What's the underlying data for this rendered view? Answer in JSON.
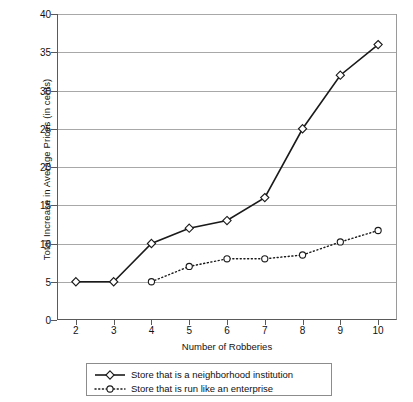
{
  "chart_data": {
    "type": "line",
    "title": "",
    "xlabel": "Number of Robberies",
    "ylabel": "Total Increase in Average Prices (in cents)",
    "x": [
      2,
      3,
      4,
      5,
      6,
      7,
      8,
      9,
      10
    ],
    "xlim": [
      1.5,
      10.5
    ],
    "ylim": [
      0,
      40
    ],
    "yticks": [
      0,
      5,
      10,
      15,
      20,
      25,
      30,
      35,
      40
    ],
    "xticks": [
      2,
      3,
      4,
      5,
      6,
      7,
      8,
      9,
      10
    ],
    "grid": "horizontal",
    "legend_position": "below",
    "series": [
      {
        "name": "Store that is a neighborhood institution",
        "marker": "diamond",
        "linestyle": "solid",
        "color": "#1a1a1a",
        "x": [
          2,
          3,
          4,
          5,
          6,
          7,
          8,
          9,
          10
        ],
        "values": [
          5,
          5,
          10,
          12,
          13,
          16,
          25,
          32,
          36
        ]
      },
      {
        "name": "Store that is run like an enterprise",
        "marker": "circle",
        "linestyle": "dotted",
        "color": "#1a1a1a",
        "x": [
          4,
          5,
          6,
          7,
          8,
          9,
          10
        ],
        "values": [
          5,
          7,
          8,
          8,
          8.5,
          10.2,
          11.7
        ]
      }
    ]
  },
  "axis": {
    "ytick_labels": [
      "0",
      "5",
      "10",
      "15",
      "20",
      "25",
      "30",
      "35",
      "40"
    ],
    "xtick_labels": [
      "2",
      "3",
      "4",
      "5",
      "6",
      "7",
      "8",
      "9",
      "10"
    ],
    "xlabel": "Number of Robberies",
    "ylabel": "Total Increase in Average Prices (in cents)"
  },
  "legend": {
    "items": [
      {
        "label": "Store that is a neighborhood institution",
        "marker": "diamond",
        "linestyle": "solid"
      },
      {
        "label": "Store that is run like an enterprise",
        "marker": "circle",
        "linestyle": "dotted"
      }
    ]
  }
}
